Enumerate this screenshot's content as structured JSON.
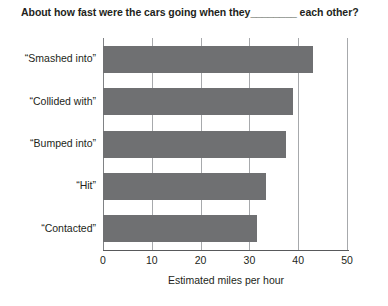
{
  "chart_data": {
    "type": "bar",
    "orientation": "horizontal",
    "title": "About how fast were the cars going when they________ each other?",
    "xlabel": "Estimated miles per hour",
    "ylabel": "",
    "xlim": [
      0,
      50
    ],
    "xticks": [
      0,
      10,
      20,
      30,
      40,
      50
    ],
    "xtick_labels": [
      "0",
      "10",
      "20",
      "30",
      "40",
      "50"
    ],
    "grid": "vertical",
    "legend": "none",
    "bar_color": "#6f7072",
    "categories": [
      "“Smashed into”",
      "“Collided with”",
      "“Bumped into”",
      "“Hit”",
      "“Contacted”"
    ],
    "values": [
      43,
      39,
      37.5,
      33.5,
      31.5
    ]
  },
  "chart": {
    "title": "About how fast were the cars going when they________ each other?",
    "xlabel": "Estimated miles per hour"
  }
}
